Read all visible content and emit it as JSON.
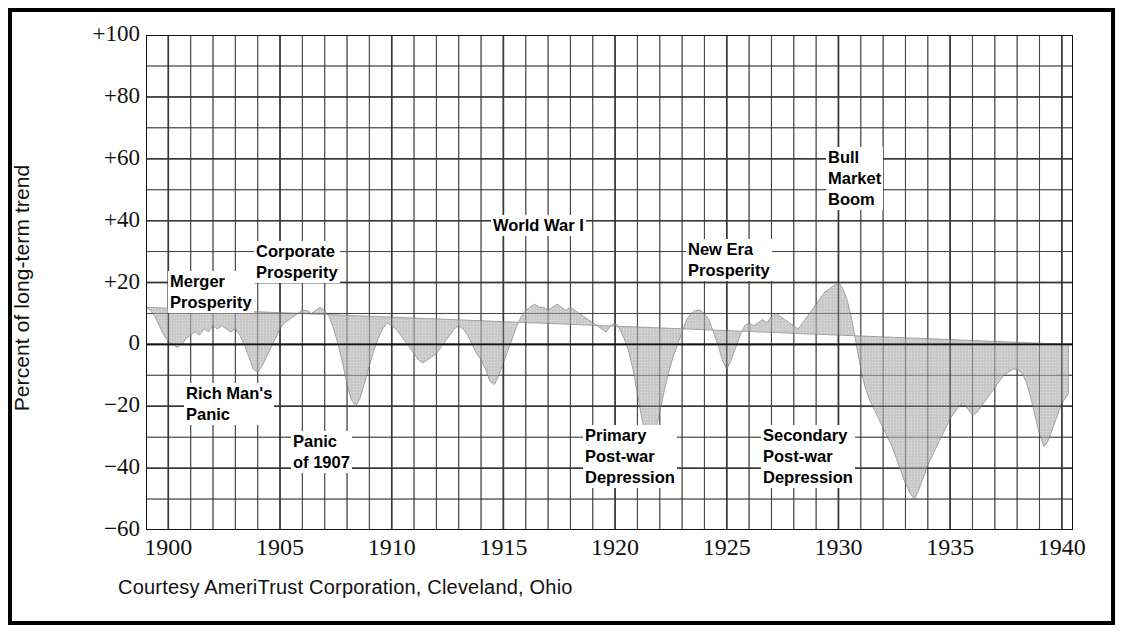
{
  "figure": {
    "caption": "Courtesy AmeriTrust Corporation, Cleveland, Ohio",
    "ylabel": "Percent of long-term trend"
  },
  "chart_data": {
    "type": "area",
    "title": "",
    "xlabel": "",
    "ylabel": "Percent of long-term trend",
    "xlim": [
      1899,
      1940.5
    ],
    "ylim": [
      -60,
      100
    ],
    "ytick_labels": [
      "+100",
      "+80",
      "+60",
      "+40",
      "+20",
      "0",
      "−20",
      "−40",
      "−60"
    ],
    "ytick_values": [
      100,
      80,
      60,
      40,
      20,
      0,
      -20,
      -40,
      -60
    ],
    "xtick_labels": [
      "1900",
      "1905",
      "1910",
      "1915",
      "1920",
      "1925",
      "1930",
      "1935",
      "1940"
    ],
    "xtick_values": [
      1900,
      1905,
      1910,
      1915,
      1920,
      1925,
      1930,
      1935,
      1940
    ],
    "grid": true,
    "grid_minor_y_step": 10,
    "grid_minor_x_step": 1,
    "legend": "none",
    "fill_color": "#c9c9c9",
    "baseline": 0,
    "x": [
      1899.0,
      1899.2,
      1899.4,
      1899.6,
      1899.8,
      1900.0,
      1900.2,
      1900.4,
      1900.6,
      1900.8,
      1901.0,
      1901.2,
      1901.4,
      1901.6,
      1901.8,
      1902.0,
      1902.2,
      1902.4,
      1902.6,
      1902.8,
      1903.0,
      1903.2,
      1903.4,
      1903.6,
      1903.8,
      1904.0,
      1904.2,
      1904.4,
      1904.6,
      1904.8,
      1905.0,
      1905.2,
      1905.4,
      1905.6,
      1905.8,
      1906.0,
      1906.2,
      1906.4,
      1906.6,
      1906.8,
      1907.0,
      1907.2,
      1907.4,
      1907.6,
      1907.8,
      1908.0,
      1908.2,
      1908.4,
      1908.6,
      1908.8,
      1909.0,
      1909.2,
      1909.4,
      1909.6,
      1909.8,
      1910.0,
      1910.2,
      1910.4,
      1910.6,
      1910.8,
      1911.0,
      1911.2,
      1911.4,
      1911.6,
      1911.8,
      1912.0,
      1912.2,
      1912.4,
      1912.6,
      1912.8,
      1913.0,
      1913.2,
      1913.4,
      1913.6,
      1913.8,
      1914.0,
      1914.2,
      1914.4,
      1914.6,
      1914.8,
      1915.0,
      1915.2,
      1915.4,
      1915.6,
      1915.8,
      1916.0,
      1916.2,
      1916.4,
      1916.6,
      1916.8,
      1917.0,
      1917.2,
      1917.4,
      1917.6,
      1917.8,
      1918.0,
      1918.2,
      1918.4,
      1918.6,
      1918.8,
      1919.0,
      1919.2,
      1919.4,
      1919.6,
      1919.8,
      1920.0,
      1920.2,
      1920.4,
      1920.6,
      1920.8,
      1921.0,
      1921.2,
      1921.4,
      1921.6,
      1921.8,
      1922.0,
      1922.2,
      1922.4,
      1922.6,
      1922.8,
      1923.0,
      1923.2,
      1923.4,
      1923.6,
      1923.8,
      1924.0,
      1924.2,
      1924.4,
      1924.6,
      1924.8,
      1925.0,
      1925.2,
      1925.4,
      1925.6,
      1925.8,
      1926.0,
      1926.2,
      1926.4,
      1926.6,
      1926.8,
      1927.0,
      1927.2,
      1927.4,
      1927.6,
      1927.8,
      1928.0,
      1928.2,
      1928.4,
      1928.6,
      1928.8,
      1929.0,
      1929.2,
      1929.4,
      1929.6,
      1929.8,
      1930.0,
      1930.2,
      1930.4,
      1930.6,
      1930.8,
      1931.0,
      1931.2,
      1931.4,
      1931.6,
      1931.8,
      1932.0,
      1932.2,
      1932.4,
      1932.6,
      1932.8,
      1933.0,
      1933.2,
      1933.4,
      1933.6,
      1933.8,
      1934.0,
      1934.2,
      1934.4,
      1934.6,
      1934.8,
      1935.0,
      1935.2,
      1935.4,
      1935.6,
      1935.8,
      1936.0,
      1936.2,
      1936.4,
      1936.6,
      1936.8,
      1937.0,
      1937.2,
      1937.4,
      1937.6,
      1937.8,
      1938.0,
      1938.2,
      1938.4,
      1938.6,
      1938.8,
      1939.0,
      1939.2,
      1939.4,
      1939.6,
      1939.8,
      1940.0,
      1940.3
    ],
    "y": [
      12,
      11,
      9,
      6,
      3,
      1,
      0,
      -1,
      0,
      2,
      3,
      4,
      3,
      5,
      4,
      6,
      5,
      6,
      5,
      4,
      5,
      3,
      0,
      -4,
      -8,
      -9,
      -7,
      -4,
      -1,
      2,
      5,
      7,
      8,
      9,
      10,
      11,
      11,
      10,
      11,
      12,
      11,
      9,
      5,
      0,
      -6,
      -13,
      -18,
      -20,
      -17,
      -12,
      -7,
      -2,
      2,
      5,
      7,
      6,
      5,
      3,
      1,
      -1,
      -3,
      -5,
      -6,
      -5,
      -4,
      -3,
      -1,
      1,
      3,
      5,
      6,
      5,
      3,
      0,
      -3,
      -5,
      -8,
      -12,
      -13,
      -10,
      -6,
      -2,
      2,
      6,
      9,
      11,
      12,
      13,
      12,
      12,
      11,
      12,
      13,
      12,
      11,
      12,
      11,
      10,
      9,
      8,
      7,
      6,
      5,
      4,
      6,
      7,
      5,
      2,
      -2,
      -8,
      -16,
      -24,
      -30,
      -32,
      -28,
      -22,
      -15,
      -9,
      -4,
      0,
      4,
      8,
      10,
      11,
      11,
      10,
      8,
      4,
      0,
      -5,
      -8,
      -5,
      -1,
      3,
      6,
      7,
      6,
      7,
      8,
      7,
      9,
      10,
      9,
      8,
      7,
      6,
      5,
      7,
      9,
      11,
      13,
      15,
      17,
      18,
      19,
      20,
      18,
      14,
      8,
      0,
      -8,
      -14,
      -18,
      -21,
      -24,
      -27,
      -30,
      -33,
      -37,
      -41,
      -45,
      -48,
      -50,
      -47,
      -43,
      -39,
      -36,
      -33,
      -30,
      -27,
      -24,
      -22,
      -20,
      -19,
      -21,
      -23,
      -22,
      -20,
      -18,
      -16,
      -14,
      -12,
      -10,
      -9,
      -8,
      -8,
      -9,
      -12,
      -17,
      -23,
      -29,
      -33,
      -31,
      -27,
      -23,
      -19,
      -16,
      -14,
      -12,
      -10,
      -9,
      -8
    ]
  },
  "annotations": [
    {
      "id": "merger-prosperity",
      "text": "Merger\nProsperity"
    },
    {
      "id": "corporate-prosperity",
      "text": "Corporate\nProsperity"
    },
    {
      "id": "rich-mans-panic",
      "text": "Rich Man's\nPanic"
    },
    {
      "id": "panic-of-1907",
      "text": "Panic\nof 1907"
    },
    {
      "id": "world-war-i",
      "text": "World War I"
    },
    {
      "id": "primary-postwar-depression",
      "text": "Primary\nPost-war\nDepression"
    },
    {
      "id": "new-era-prosperity",
      "text": "New Era\nProsperity"
    },
    {
      "id": "bull-market-boom",
      "text": "Bull\nMarket\nBoom"
    },
    {
      "id": "secondary-postwar-depression",
      "text": "Secondary\nPost-war\nDepression"
    }
  ],
  "annotation_text": {
    "merger_prosperity": "Merger\nProsperity",
    "corporate_prosperity": "Corporate\nProsperity",
    "rich_mans_panic": "Rich Man's\nPanic",
    "panic_of_1907": "Panic\nof 1907",
    "world_war_i": "World War I",
    "primary_postwar_depression": "Primary\nPost-war\nDepression",
    "new_era_prosperity": "New Era\nProsperity",
    "bull_market_boom": "Bull\nMarket\nBoom",
    "secondary_postwar_depression": "Secondary\nPost-war\nDepression"
  }
}
